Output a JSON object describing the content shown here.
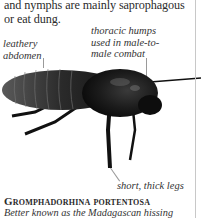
{
  "body_text": "and nymphs are mainly saprophagous or eat dung.",
  "labels": {
    "abdomen": "leathery abdomen",
    "humps": "thoracic humps used in male-to-male combat",
    "legs": "short, thick legs"
  },
  "species": {
    "name": "Gromphadorhina portentosa",
    "description": "Better known as the Madagascan hissing"
  },
  "colors": {
    "text": "#2b2b2b",
    "rule": "#c8c8c8",
    "insect": "#1a1a1a"
  }
}
